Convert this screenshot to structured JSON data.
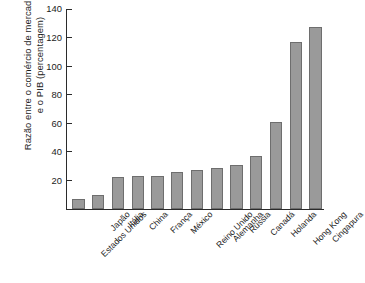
{
  "chart_data": {
    "type": "bar",
    "title": "",
    "xlabel": "",
    "ylabel": "Razão entre o comércio de mercadorias e o PIB (percentagem)",
    "ylabel_lines": [
      "Razão entre o comércio de mercadorias",
      "e o PIB (percentagem)"
    ],
    "ylim": [
      0,
      140
    ],
    "ytick_values": [
      0,
      20,
      40,
      60,
      80,
      100,
      120,
      140
    ],
    "ytick_labels": [
      "",
      "20",
      "40",
      "60",
      "80",
      "100",
      "120",
      "140"
    ],
    "grid": false,
    "legend": "none",
    "bar_color": "#9a9a9a",
    "bar_edge_color": "#6e6e6e",
    "axis_color": "#2b2b2b",
    "categories": [
      "Estados Unidos",
      "Japão",
      "Itália",
      "China",
      "França",
      "México",
      "Reino Unido",
      "Alemanha",
      "Rússia",
      "Canadá",
      "Holanda",
      "Hong Kong",
      "Cingapura"
    ],
    "values": [
      7,
      10,
      22.5,
      23,
      23,
      26,
      27.5,
      29,
      30.5,
      37,
      61,
      117,
      127.5
    ]
  }
}
